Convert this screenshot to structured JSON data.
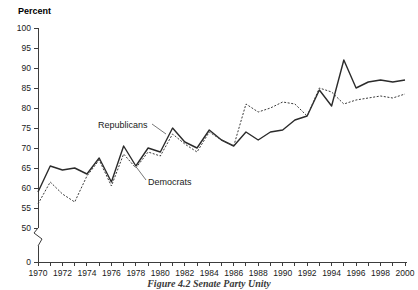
{
  "figure": {
    "caption": "Figure 4.2   Senate Party Unity"
  },
  "axes": {
    "y_title": "Percent",
    "y_ticks": [
      "100",
      "95",
      "90",
      "85",
      "80",
      "75",
      "70",
      "65",
      "60",
      "55",
      "50",
      "0"
    ],
    "x_ticks": [
      "1970",
      "1972",
      "1974",
      "1976",
      "1978",
      "1980",
      "1982",
      "1984",
      "1986",
      "1988",
      "1990",
      "1992",
      "1994",
      "1996",
      "1998",
      "2000"
    ]
  },
  "annotations": {
    "republicans_label": "Republicans",
    "democrats_label": "Democrats"
  },
  "chart_data": {
    "type": "line",
    "title": "Figure 4.2   Senate Party Unity",
    "xlabel": "",
    "ylabel": "Percent",
    "ylim": [
      50,
      100
    ],
    "xlim": [
      1970,
      2000
    ],
    "grid": false,
    "legend": "inline-annotations",
    "y_axis_break": {
      "from": 0,
      "to": 50
    },
    "y_tick_values": [
      100,
      95,
      90,
      85,
      80,
      75,
      70,
      65,
      60,
      55,
      50,
      0
    ],
    "x_tick_values": [
      1970,
      1971,
      1972,
      1973,
      1974,
      1975,
      1976,
      1977,
      1978,
      1979,
      1980,
      1981,
      1982,
      1983,
      1984,
      1985,
      1986,
      1987,
      1988,
      1989,
      1990,
      1991,
      1992,
      1993,
      1994,
      1995,
      1996,
      1997,
      1998,
      1999,
      2000
    ],
    "x_labeled_values": [
      1970,
      1972,
      1974,
      1976,
      1978,
      1980,
      1982,
      1984,
      1986,
      1988,
      1990,
      1992,
      1994,
      1996,
      1998,
      2000
    ],
    "x": [
      1970,
      1971,
      1972,
      1973,
      1974,
      1975,
      1976,
      1977,
      1978,
      1979,
      1980,
      1981,
      1982,
      1983,
      1984,
      1985,
      1986,
      1987,
      1988,
      1989,
      1990,
      1991,
      1992,
      1993,
      1994,
      1995,
      1996,
      1997,
      1998,
      1999,
      2000
    ],
    "series": [
      {
        "name": "Republicans",
        "style": "solid",
        "color": "#2b2b2b",
        "values": [
          59,
          65.5,
          64.5,
          65,
          63.5,
          67.5,
          61.5,
          70.5,
          65.5,
          70,
          69,
          75,
          71.5,
          70,
          74.5,
          72,
          70.5,
          74,
          72,
          74,
          74.5,
          77,
          78,
          84.5,
          80.5,
          92,
          85,
          86.5,
          87,
          86.5,
          87
        ]
      },
      {
        "name": "Democrats",
        "style": "dashed",
        "color": "#3a3a3a",
        "values": [
          56,
          61.5,
          58.5,
          56.5,
          63,
          67,
          60.5,
          68.5,
          65,
          69,
          68,
          73.5,
          71,
          69,
          74,
          72,
          70.5,
          81,
          79,
          80,
          81.5,
          81,
          78,
          85,
          84,
          81,
          82,
          82.5,
          83,
          82.5,
          83.5
        ]
      }
    ]
  }
}
